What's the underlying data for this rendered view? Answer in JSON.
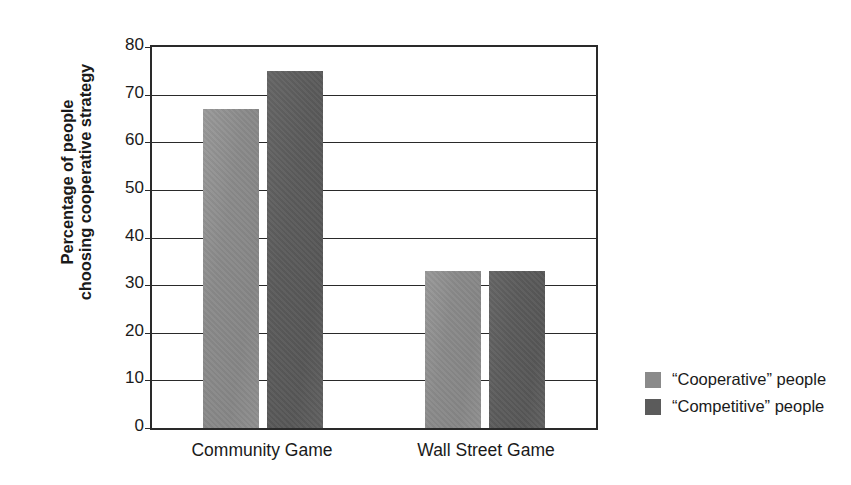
{
  "chart_data": {
    "type": "bar",
    "title": "",
    "xlabel": "",
    "ylabel_lines": [
      "Percentage of people",
      "choosing cooperative strategy"
    ],
    "ylabel": "Percentage of people choosing cooperative strategy",
    "categories": [
      "Community Game",
      "Wall Street Game"
    ],
    "series": [
      {
        "name": "“Cooperative” people",
        "values": [
          67,
          33
        ],
        "color": "#8a8a8a"
      },
      {
        "name": "“Competitive” people",
        "values": [
          75,
          33
        ],
        "color": "#5b5b5b"
      }
    ],
    "ylim": [
      0,
      80
    ],
    "ytick_values": [
      0,
      10,
      20,
      30,
      40,
      50,
      60,
      70,
      80
    ],
    "ytick_labels": [
      "0",
      "10",
      "20",
      "30",
      "40",
      "50",
      "60",
      "70",
      "80"
    ],
    "grid": true,
    "grid_axis": "y",
    "legend_position": "right",
    "axis_color": "#2a2a2a",
    "background_color": "#ffffff"
  },
  "legend": {
    "items": [
      {
        "label": "“Cooperative” people",
        "swatch": "light"
      },
      {
        "label": "“Competitive” people",
        "swatch": "dark"
      }
    ]
  }
}
